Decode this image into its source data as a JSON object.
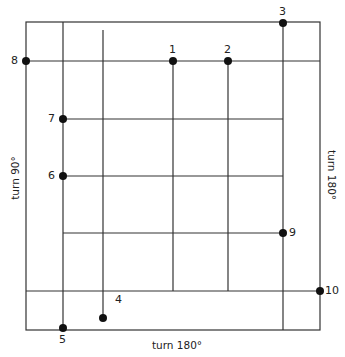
{
  "diagram": {
    "stroke_color": "#333333",
    "dot_color": "#111111",
    "outer_rect": {
      "x1": 26,
      "y1": 22,
      "x2": 320,
      "y2": 330
    },
    "h_lines": [
      {
        "y": 61,
        "x1": 26,
        "x2": 320
      },
      {
        "y": 119,
        "x1": 63,
        "x2": 283
      },
      {
        "y": 176,
        "x1": 63,
        "x2": 283
      },
      {
        "y": 233,
        "x1": 63,
        "x2": 283
      },
      {
        "y": 291,
        "x1": 26,
        "x2": 320
      }
    ],
    "v_lines": [
      {
        "x": 63,
        "y1": 22,
        "y2": 330
      },
      {
        "x": 103,
        "y1": 30,
        "y2": 318
      },
      {
        "x": 173,
        "y1": 61,
        "y2": 291
      },
      {
        "x": 228,
        "y1": 61,
        "y2": 291
      },
      {
        "x": 283,
        "y1": 22,
        "y2": 330
      }
    ],
    "points": [
      {
        "label": "1",
        "x": 173,
        "y": 61,
        "lx": 169,
        "ly": 44
      },
      {
        "label": "2",
        "x": 228,
        "y": 61,
        "lx": 224,
        "ly": 44
      },
      {
        "label": "3",
        "x": 283,
        "y": 23,
        "lx": 279,
        "ly": 6
      },
      {
        "label": "4",
        "x": 103,
        "y": 318,
        "lx": 115,
        "ly": 294
      },
      {
        "label": "5",
        "x": 63,
        "y": 328,
        "lx": 59,
        "ly": 334
      },
      {
        "label": "6",
        "x": 63,
        "y": 176,
        "lx": 48,
        "ly": 170
      },
      {
        "label": "7",
        "x": 63,
        "y": 119,
        "lx": 48,
        "ly": 113
      },
      {
        "label": "8",
        "x": 26,
        "y": 61,
        "lx": 11,
        "ly": 55
      },
      {
        "label": "9",
        "x": 283,
        "y": 233,
        "lx": 289,
        "ly": 227
      },
      {
        "label": "10",
        "x": 320,
        "y": 291,
        "lx": 325,
        "ly": 285
      }
    ],
    "side_labels": {
      "left": "turn 90°",
      "right": "turn 180°",
      "bottom": "turn 180°"
    }
  }
}
